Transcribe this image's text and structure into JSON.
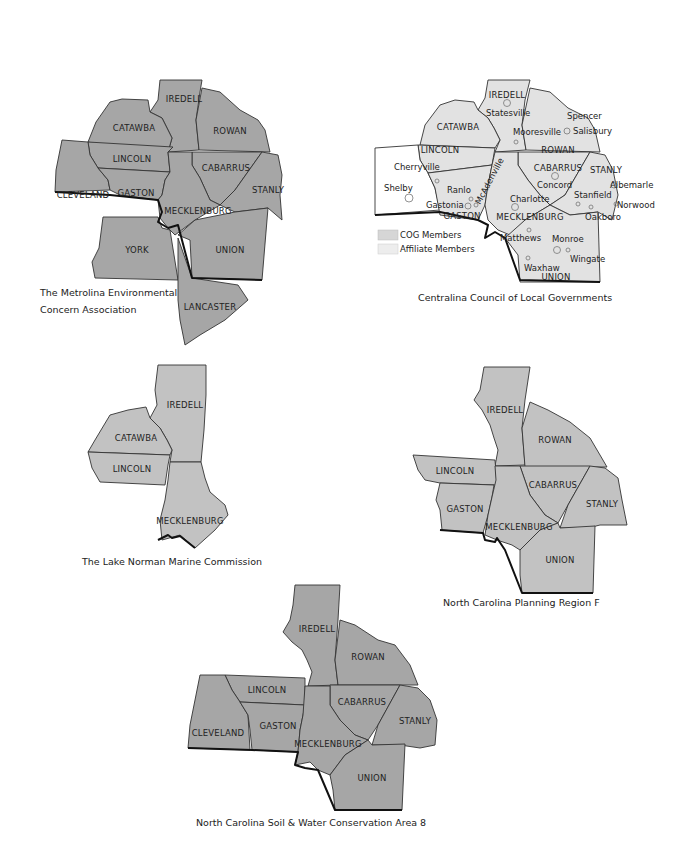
{
  "maps": {
    "metrolina": {
      "caption_line1": "The Metrolina Environmental",
      "caption_line2": "Concern Association",
      "counties": [
        "IREDELL",
        "CATAWBA",
        "ROWAN",
        "LINCOLN",
        "CABARRUS",
        "CLEVELAND",
        "GASTON",
        "STANLY",
        "MECKLENBURG",
        "YORK",
        "UNION",
        "LANCASTER"
      ]
    },
    "centralina": {
      "caption": "Centralina Council of Local Governments",
      "counties": [
        "IREDELL",
        "CATAWBA",
        "ROWAN",
        "LINCOLN",
        "CABARRUS",
        "STANLY",
        "GASTON",
        "MECKLENBURG",
        "UNION"
      ],
      "cities": [
        "Statesville",
        "Spencer",
        "Salisbury",
        "Mooresville",
        "Cherryville",
        "Concord",
        "Albemarle",
        "Shelby",
        "Ranlo",
        "McAdenville",
        "Stanfield",
        "Norwood",
        "Gastonia",
        "Charlotte",
        "Oakboro",
        "Matthews",
        "Monroe",
        "Wingate",
        "Waxhaw"
      ],
      "legend": {
        "cog": "COG Members",
        "affiliate": "Affiliate Members"
      }
    },
    "lake_norman": {
      "caption": "The Lake Norman Marine Commission",
      "counties": [
        "IREDELL",
        "CATAWBA",
        "LINCOLN",
        "MECKLENBURG"
      ]
    },
    "region_f": {
      "caption": "North Carolina Planning Region F",
      "counties": [
        "IREDELL",
        "ROWAN",
        "LINCOLN",
        "CABARRUS",
        "GASTON",
        "STANLY",
        "MECKLENBURG",
        "UNION"
      ]
    },
    "soil_water": {
      "caption": "North Carolina Soil & Water Conservation Area 8",
      "counties": [
        "IREDELL",
        "ROWAN",
        "LINCOLN",
        "CABARRUS",
        "CLEVELAND",
        "GASTON",
        "STANLY",
        "MECKLENBURG",
        "UNION"
      ]
    }
  },
  "colors": {
    "member_fill": "#a6a6a6",
    "light_fill": "#e2e2e2",
    "mid_fill": "#c2c2c2",
    "state_border": "#111111"
  }
}
